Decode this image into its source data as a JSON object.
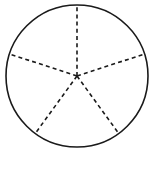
{
  "figure": {
    "name": "circle-divided-into-five-equal-sectors",
    "canvas": {
      "width": 151,
      "height": 173,
      "background_color": "#ffffff"
    },
    "circle": {
      "center_x": 77,
      "center_y": 76,
      "radius": 71,
      "stroke_color": "#1a1a1a",
      "stroke_width": 1.6,
      "fill": "none",
      "style": "solid"
    },
    "radii": {
      "count": 5,
      "stroke_color": "#1a1a1a",
      "stroke_width": 1.6,
      "style": "dashed",
      "dash_length": 4,
      "gap_length": 3.2,
      "angle_step_degrees": 72,
      "spokes": [
        {
          "label": "radius-up",
          "angle_degrees": 90,
          "end_x": 77,
          "end_y": 5
        },
        {
          "label": "radius-upper-left",
          "angle_degrees": 162,
          "end_x": 9.5,
          "end_y": 54
        },
        {
          "label": "radius-lower-left",
          "angle_degrees": 234,
          "end_x": 35.3,
          "end_y": 133.4
        },
        {
          "label": "radius-lower-right",
          "angle_degrees": 306,
          "end_x": 118.7,
          "end_y": 133.4
        },
        {
          "label": "radius-upper-right",
          "angle_degrees": 18,
          "end_x": 144.5,
          "end_y": 54
        }
      ]
    },
    "sectors": {
      "count": 5,
      "each_fraction": "1/5",
      "each_angle_degrees": 72
    }
  },
  "chart_data": {
    "type": "pie",
    "title": "",
    "categories": [
      "1/5",
      "1/5",
      "1/5",
      "1/5",
      "1/5"
    ],
    "values": [
      20,
      20,
      20,
      20,
      20
    ],
    "unit": "percent",
    "start_angle_degrees": 90,
    "direction": "counterclockwise",
    "legend": "none",
    "grid": false,
    "slice_fill": "none",
    "slice_divider_style": "dashed",
    "outline_style": "solid"
  }
}
